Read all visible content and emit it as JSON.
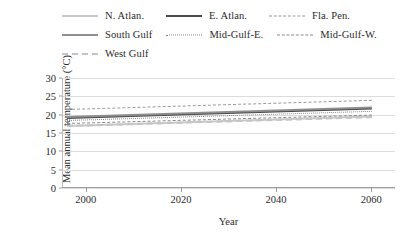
{
  "chart_data": {
    "type": "line",
    "title": "",
    "xlabel": "Year",
    "ylabel": "Mean annual temperature (°C)",
    "xlim": [
      1995,
      2065
    ],
    "ylim": [
      0,
      30
    ],
    "xticks": [
      2000,
      2020,
      2040,
      2060
    ],
    "yticks": [
      0,
      5,
      10,
      15,
      20,
      25,
      30
    ],
    "grid": true,
    "legend_position": "top",
    "x": [
      1996,
      2060
    ],
    "series": [
      {
        "name": "N. Atlan.",
        "style": "solid-light",
        "color": "#c9c9c9",
        "values": [
          17.3,
          19.9
        ]
      },
      {
        "name": "E. Atlan.",
        "style": "solid-dark",
        "color": "#4a4a4a",
        "values": [
          19.3,
          21.9
        ]
      },
      {
        "name": "Fla. Pen.",
        "style": "dash-mid",
        "color": "#9a9a9a",
        "values": [
          21.6,
          24.1
        ]
      },
      {
        "name": "South Gulf",
        "style": "solid-mid",
        "color": "#8e8e8e",
        "values": [
          19.6,
          22.2
        ]
      },
      {
        "name": "Mid-Gulf-E.",
        "style": "dot-mid",
        "color": "#8a8a8a",
        "values": [
          18.6,
          21.1
        ]
      },
      {
        "name": "Mid-Gulf-W.",
        "style": "dashdot-mid",
        "color": "#8a8a8a",
        "values": [
          17.8,
          20.1
        ]
      },
      {
        "name": "West Gulf",
        "style": "dash-light",
        "color": "#c4c4c4",
        "values": [
          17.2,
          19.6
        ]
      }
    ]
  },
  "legend": {
    "rows": [
      [
        {
          "label": "N. Atlan.",
          "style": "solid-light"
        },
        {
          "label": "E. Atlan.",
          "style": "solid-dark"
        },
        {
          "label": "Fla. Pen.",
          "style": "dash-mid"
        }
      ],
      [
        {
          "label": "South Gulf",
          "style": "solid-mid"
        },
        {
          "label": "Mid-Gulf-E.",
          "style": "dot-mid"
        },
        {
          "label": "Mid-Gulf-W.",
          "style": "dashdot-mid"
        }
      ],
      [
        {
          "label": "West Gulf",
          "style": "dash-light"
        }
      ]
    ]
  }
}
